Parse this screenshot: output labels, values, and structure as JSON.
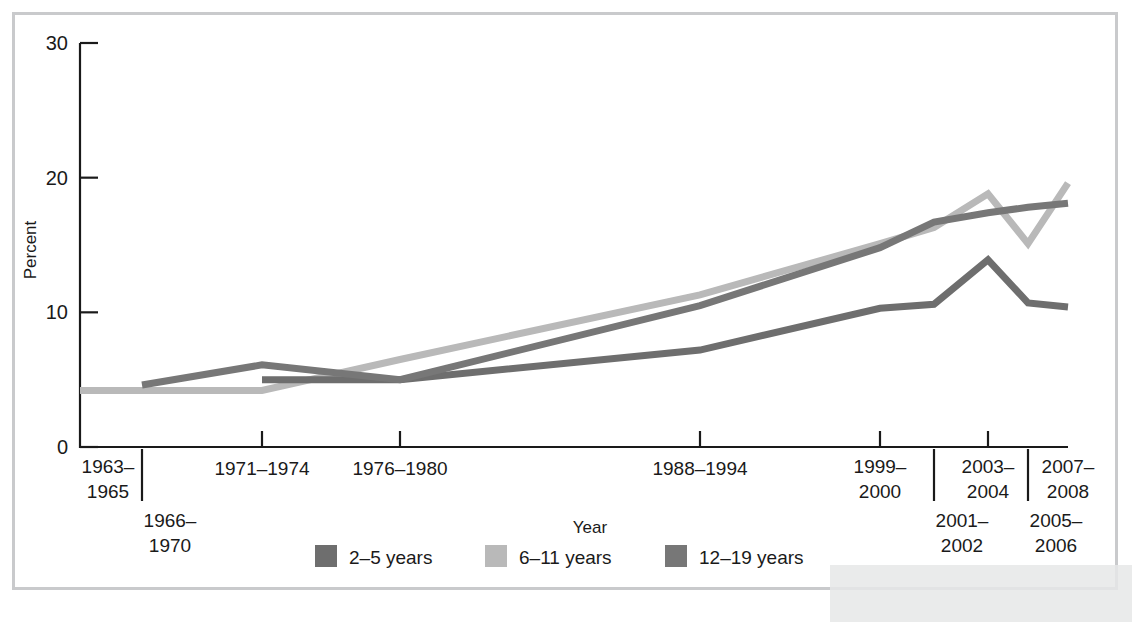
{
  "figure": {
    "plot_bg": "#ffffff",
    "frame_color": "#c9cacc",
    "axis_color": "#1a1a1a"
  },
  "chart_data": {
    "type": "line",
    "title": "",
    "xlabel": "Year",
    "ylabel": "Percent",
    "ylim": [
      0,
      30
    ],
    "yticks": [
      0,
      10,
      20,
      30
    ],
    "ytick_labels": [
      "0",
      "10",
      "20",
      "30"
    ],
    "grid": false,
    "legend_position": "bottom",
    "categories": [
      "1963-1965",
      "1966-1970",
      "1971-1974",
      "1976-1980",
      "1988-1994",
      "1999-2000",
      "2001-2002",
      "2003-2004",
      "2005-2006",
      "2007-2008"
    ],
    "tick_labels": [
      {
        "label": "1963–1965",
        "row": 0
      },
      {
        "label": "1966–1970",
        "row": 1
      },
      {
        "label": "1971–1974",
        "row": 0
      },
      {
        "label": "1976–1980",
        "row": 0
      },
      {
        "label": "1988–1994",
        "row": 0
      },
      {
        "label": "1999–2000",
        "row": 0
      },
      {
        "label": "2001–2002",
        "row": 1
      },
      {
        "label": "2003–2004",
        "row": 0
      },
      {
        "label": "2005–2006",
        "row": 1
      },
      {
        "label": "2007–2008",
        "row": 0
      }
    ],
    "series": [
      {
        "name": "2–5 years",
        "color": "#6e6e6e",
        "x": [
          "1971-1974",
          "1976-1980",
          "1988-1994",
          "1999-2000",
          "2001-2002",
          "2003-2004",
          "2005-2006",
          "2007-2008"
        ],
        "values": [
          5.0,
          5.0,
          7.2,
          10.3,
          10.6,
          13.9,
          10.7,
          10.4
        ]
      },
      {
        "name": "6–11 years",
        "color": "#b9b9b9",
        "x": [
          "1963-1965",
          "1971-1974",
          "1976-1980",
          "1988-1994",
          "1999-2000",
          "2001-2002",
          "2003-2004",
          "2005-2006",
          "2007-2008"
        ],
        "values": [
          4.2,
          4.2,
          6.5,
          11.3,
          15.1,
          16.3,
          18.8,
          15.1,
          19.6
        ]
      },
      {
        "name": "12–19 years",
        "color": "#777777",
        "x": [
          "1966-1970",
          "1971-1974",
          "1976-1980",
          "1988-1994",
          "1999-2000",
          "2001-2002",
          "2003-2004",
          "2005-2006",
          "2007-2008"
        ],
        "values": [
          4.6,
          6.1,
          5.0,
          10.5,
          14.8,
          16.7,
          17.4,
          17.8,
          18.1
        ]
      }
    ]
  },
  "legend": {
    "items": [
      {
        "label": "2–5 years",
        "color": "#6e6e6e"
      },
      {
        "label": "6–11 years",
        "color": "#b9b9b9"
      },
      {
        "label": "12–19 years",
        "color": "#777777"
      }
    ]
  }
}
